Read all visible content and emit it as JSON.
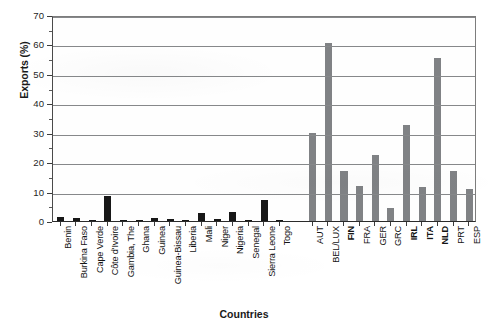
{
  "chart_data": {
    "type": "bar",
    "title": "",
    "xlabel": "Countries",
    "ylabel": "Exports (%)",
    "ylim": [
      0,
      70
    ],
    "ytick_step": 10,
    "yticks": [
      0,
      10,
      20,
      30,
      40,
      50,
      60,
      70
    ],
    "grid": "horizontal",
    "legend": "none",
    "groups": [
      {
        "name": "West African countries",
        "color": "#171717",
        "categories": [
          "Benin",
          "Burkina Faso",
          "Cape Verde",
          "Côte d'Ivoire",
          "Gambia, The",
          "Ghana",
          "Guinea",
          "Guinea-Bissau",
          "Liberia",
          "Mali",
          "Niger",
          "Nigeria",
          "Senegal",
          "Sierra Leone",
          "Togo"
        ],
        "values": [
          1.2,
          0.9,
          0.4,
          8.5,
          0.2,
          0.4,
          1.0,
          0.8,
          0.5,
          2.7,
          0.6,
          3.1,
          0.3,
          7.0,
          0.2
        ]
      },
      {
        "name": "European Union countries",
        "color": "#808285",
        "categories": [
          "AUT",
          "BEL/LUX",
          "FIN",
          "FRA",
          "GER",
          "GRC",
          "IRL",
          "ITA",
          "NLD",
          "PRT",
          "ESP"
        ],
        "bold_categories": [
          "FIN",
          "IRL",
          "ITA",
          "NLD"
        ],
        "values": [
          30.0,
          60.5,
          17.0,
          12.0,
          22.5,
          4.5,
          32.5,
          11.5,
          55.5,
          17.0,
          11.0
        ]
      }
    ]
  },
  "axes": {
    "y_title": "Exports (%)",
    "x_title": "Countries",
    "y_tick_labels": [
      "0",
      "10",
      "20",
      "30",
      "40",
      "50",
      "60",
      "70"
    ]
  }
}
